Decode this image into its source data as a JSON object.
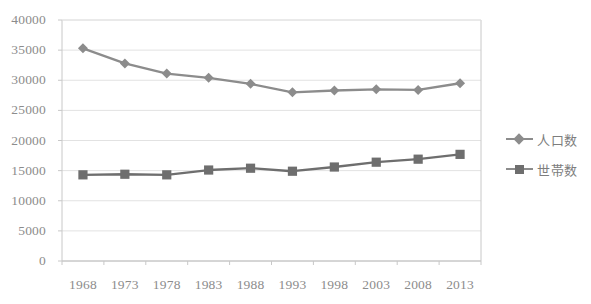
{
  "chart_data": {
    "type": "line",
    "title": "",
    "subtitle": "",
    "xlabel": "",
    "ylabel": "",
    "categories": [
      "1968",
      "1973",
      "1978",
      "1983",
      "1988",
      "1993",
      "1998",
      "2003",
      "2008",
      "2013"
    ],
    "series": [
      {
        "name": "人口数",
        "marker": "diamond",
        "color": "#8c8c8c",
        "values": [
          35300,
          32800,
          31100,
          30400,
          29400,
          28000,
          28300,
          28500,
          28400,
          29500
        ]
      },
      {
        "name": "世帯数",
        "marker": "square",
        "color": "#6e6e6e",
        "values": [
          14300,
          14400,
          14300,
          15100,
          15400,
          14900,
          15600,
          16400,
          16900,
          17700
        ]
      }
    ],
    "ylim": [
      0,
      40000
    ],
    "ytick_step": 5000,
    "yticks": [
      0,
      5000,
      10000,
      15000,
      20000,
      25000,
      30000,
      35000,
      40000
    ],
    "ytick_labels": [
      "0",
      "5000",
      "10000",
      "15000",
      "20000",
      "25000",
      "30000",
      "35000",
      "40000"
    ],
    "grid": true,
    "grid_axis": "y",
    "legend_position": "right",
    "legend": [
      "人口数",
      "世帯数"
    ],
    "axis_color": "#c8c8c8",
    "grid_color": "#e2e2e2",
    "tick_label_color": "#8c8c8c",
    "background": "#ffffff"
  },
  "plot": {
    "left": 62,
    "right": 481,
    "top": 20,
    "bottom": 261
  }
}
